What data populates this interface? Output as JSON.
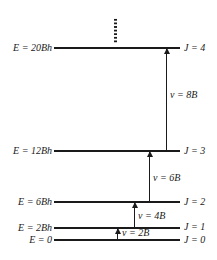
{
  "diagram": {
    "levels": [
      {
        "J_label": "J = 4",
        "E_label": "E = 20Bh",
        "y": 47
      },
      {
        "J_label": "J = 3",
        "E_label": "E = 12Bh",
        "y": 150
      },
      {
        "J_label": "J = 2",
        "E_label": "E = 6Bh",
        "y": 201
      },
      {
        "J_label": "J = 1",
        "E_label": "E = 2Bh",
        "y": 227
      },
      {
        "J_label": "J = 0",
        "E_label": "E = 0",
        "y": 239
      }
    ],
    "transitions": [
      {
        "label": "ν = 8B",
        "from": "J = 3",
        "to": "J = 4"
      },
      {
        "label": "ν = 6B",
        "from": "J = 2",
        "to": "J = 3"
      },
      {
        "label": "ν = 4B",
        "from": "J = 1",
        "to": "J = 2"
      },
      {
        "label": "ν = 2B",
        "from": "J = 0",
        "to": "J = 1"
      }
    ],
    "continuation": "⋮"
  }
}
